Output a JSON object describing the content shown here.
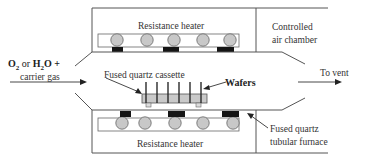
{
  "diagram": {
    "labels": {
      "top_heater": "Resistance heater",
      "bottom_heater": "Resistance heater",
      "air_chamber_line1": "Controlled",
      "air_chamber_line2": "air chamber",
      "gas_in_line1_parts": [
        "O",
        "2",
        " or ",
        "H",
        "2",
        "O +"
      ],
      "gas_in_line2": "carrier gas",
      "cassette": "Fused quartz cassette",
      "wafers": "Wafers",
      "vent": "To vent",
      "furnace_line1": "Fused quartz",
      "furnace_line2": "tubular furnace"
    },
    "colors": {
      "line": "#555555",
      "roller_fill": "#c8c8c8",
      "block_fill": "#151515",
      "cassette_fill": "#c9c9c9",
      "background": "#ffffff"
    },
    "counts": {
      "top_rollers": 5,
      "bottom_rollers": 5,
      "top_blocks": 3,
      "bottom_blocks": 3,
      "wafers": 6
    }
  }
}
